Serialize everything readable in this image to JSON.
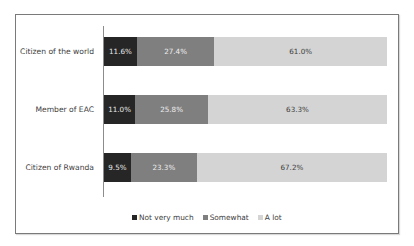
{
  "chart_data": {
    "type": "bar",
    "orientation": "horizontal",
    "stacked": "100%",
    "title": "",
    "xlabel": "",
    "ylabel": "",
    "xlim": [
      0,
      100
    ],
    "grid": false,
    "legend_position": "bottom",
    "categories": [
      "Citizen of the world",
      "Member of EAC",
      "Citizen of Rwanda"
    ],
    "series": [
      {
        "name": "Not very much",
        "color": "#262626",
        "values": [
          11.6,
          11.0,
          9.5
        ],
        "labels": [
          "11.6%",
          "11.0%",
          "9.5%"
        ]
      },
      {
        "name": "Somewhat",
        "color": "#7f7f7f",
        "values": [
          27.4,
          25.8,
          23.3
        ],
        "labels": [
          "27.4%",
          "25.8%",
          "23.3%"
        ]
      },
      {
        "name": "A lot",
        "color": "#d4d4d4",
        "values": [
          61.0,
          63.3,
          67.2
        ],
        "labels": [
          "61.0%",
          "63.3%",
          "67.2%"
        ]
      }
    ]
  },
  "rows": [
    {
      "label": "Citizen of the world",
      "segments": [
        {
          "value": 11.6,
          "text": "11.6%"
        },
        {
          "value": 27.4,
          "text": "27.4%"
        },
        {
          "value": 61.0,
          "text": "61.0%"
        }
      ]
    },
    {
      "label": "Member of EAC",
      "segments": [
        {
          "value": 11.0,
          "text": "11.0%"
        },
        {
          "value": 25.8,
          "text": "25.8%"
        },
        {
          "value": 63.3,
          "text": "63.3%"
        }
      ]
    },
    {
      "label": "Citizen of Rwanda",
      "segments": [
        {
          "value": 9.5,
          "text": "9.5%"
        },
        {
          "value": 23.3,
          "text": "23.3%"
        },
        {
          "value": 67.2,
          "text": "67.2%"
        }
      ]
    }
  ],
  "legend": [
    {
      "label": "Not very much",
      "color": "#262626"
    },
    {
      "label": "Somewhat",
      "color": "#7f7f7f"
    },
    {
      "label": "A lot",
      "color": "#d4d4d4"
    }
  ]
}
